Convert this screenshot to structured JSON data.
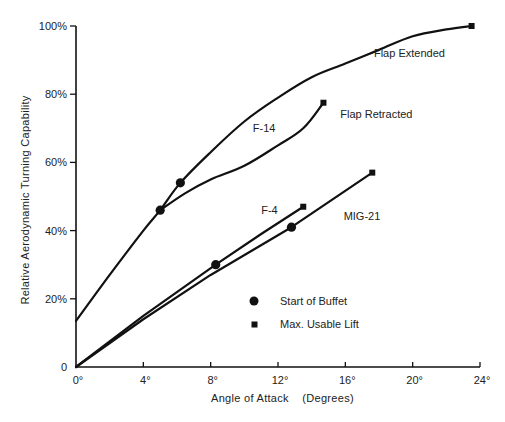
{
  "chart_data": {
    "type": "line",
    "title": "",
    "xlabel": "Angle of Attack    (Degrees)",
    "ylabel": "Relative  Aerodynamic  Turning  Capability",
    "xlim": [
      0,
      24
    ],
    "ylim": [
      0,
      100
    ],
    "x_ticks": [
      0,
      4,
      8,
      12,
      16,
      20,
      24
    ],
    "x_tick_labels": [
      "0°",
      "4°",
      "8°",
      "12°",
      "16°",
      "20°",
      "24°"
    ],
    "y_ticks": [
      0,
      20,
      40,
      60,
      80,
      100
    ],
    "y_tick_labels": [
      "0",
      "20%",
      "40%",
      "60%",
      "80%",
      "100%"
    ],
    "grid": false,
    "legend": {
      "position": "lower-center",
      "entries": [
        {
          "marker": "circle",
          "label": "Start of Buffet"
        },
        {
          "marker": "square",
          "label": "Max. Usable Lift"
        }
      ]
    },
    "series": [
      {
        "name": "F-14 Flap Extended",
        "x": [
          0,
          2,
          4,
          5,
          6.2,
          8,
          10,
          12,
          14,
          16,
          18,
          20,
          22,
          23.5
        ],
        "y": [
          13.5,
          27,
          40,
          46,
          54,
          63,
          72,
          79,
          85,
          89,
          93,
          97,
          99,
          100
        ],
        "buffet": {
          "x": 6.2,
          "y": 54
        },
        "max_usable_lift": {
          "x": 23.5,
          "y": 100
        }
      },
      {
        "name": "F-14 Flap Retracted",
        "x": [
          5,
          6.5,
          8,
          10,
          12,
          13.5,
          14.7
        ],
        "y": [
          46,
          51,
          55,
          59,
          65,
          70,
          77.5
        ],
        "buffet": {
          "x": 5,
          "y": 46
        },
        "max_usable_lift": {
          "x": 14.7,
          "y": 77.5
        }
      },
      {
        "name": "F-4",
        "x": [
          0,
          4,
          8.3,
          11,
          13.5
        ],
        "y": [
          0,
          15,
          30,
          39,
          47
        ],
        "buffet": {
          "x": 8.3,
          "y": 30
        },
        "max_usable_lift": {
          "x": 13.5,
          "y": 47
        }
      },
      {
        "name": "MIG-21",
        "x": [
          0,
          4,
          8,
          12.8,
          17.6
        ],
        "y": [
          0,
          14,
          27,
          41,
          57
        ],
        "buffet": {
          "x": 12.8,
          "y": 41
        },
        "max_usable_lift": {
          "x": 17.6,
          "y": 57
        }
      }
    ],
    "annotations": [
      {
        "text": "Flap Extended",
        "x": 17.7,
        "y": 91
      },
      {
        "text": "Flap Retracted",
        "x": 15.7,
        "y": 73
      },
      {
        "text": "F-14",
        "x": 10.5,
        "y": 69
      },
      {
        "text": "F-4",
        "x": 11,
        "y": 45
      },
      {
        "text": "MIG-21",
        "x": 15.9,
        "y": 43
      }
    ]
  },
  "colors": {
    "line": "#111111",
    "background": "#ffffff"
  }
}
